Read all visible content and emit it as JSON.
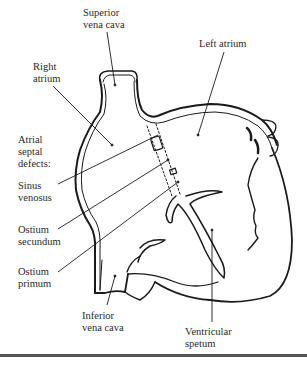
{
  "figure": {
    "type": "anatomical-diagram",
    "colors": {
      "ink": "#1a1a1a",
      "text": "#2a2a2a",
      "rule": "#555555",
      "background": "#ffffff"
    }
  },
  "labels": {
    "superior_vena_cava": {
      "line1": "Superior",
      "line2": "vena cava"
    },
    "right_atrium": {
      "line1": "Right",
      "line2": "atrium"
    },
    "left_atrium": {
      "line1": "Left atrium"
    },
    "atrial_septal_defects": {
      "line1": "Atrial",
      "line2": "septal",
      "line3": "defects:"
    },
    "sinus_venosus": {
      "line1": "Sinus",
      "line2": "venosus"
    },
    "ostium_secundum": {
      "line1": "Ostium",
      "line2": "secundum"
    },
    "ostium_primum": {
      "line1": "Ostium",
      "line2": "primum"
    },
    "inferior_vena_cava": {
      "line1": "Inferior",
      "line2": "vena cava"
    },
    "ventricular_septum": {
      "line1": "Ventricular",
      "line2": "spetum"
    }
  }
}
